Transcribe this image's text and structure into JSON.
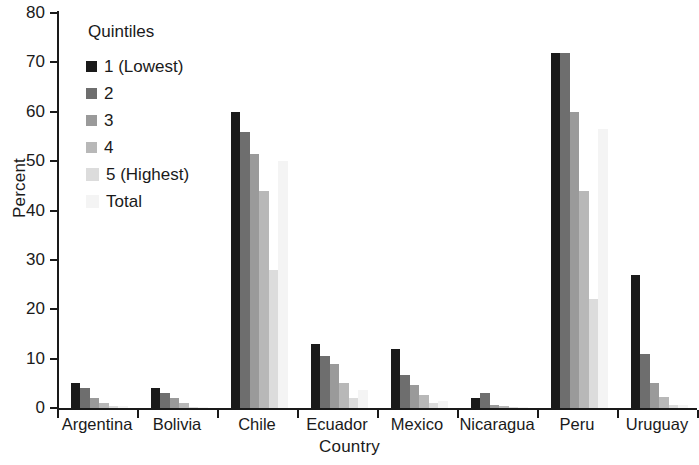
{
  "chart_data": {
    "type": "bar",
    "title": "",
    "xlabel": "Country",
    "ylabel": "Percent",
    "ylim": [
      0,
      80
    ],
    "yticks": [
      0,
      10,
      20,
      30,
      40,
      50,
      60,
      70,
      80
    ],
    "grid": false,
    "legend_position": "top-left",
    "legend_title": "Quintiles",
    "categories": [
      "Argentina",
      "Bolivia",
      "Chile",
      "Ecuador",
      "Mexico",
      "Nicaragua",
      "Peru",
      "Uruguay"
    ],
    "series": [
      {
        "name": "1 (Lowest)",
        "color": "#1a1a1a",
        "values": [
          5,
          4,
          60,
          13,
          12,
          2,
          72,
          27
        ]
      },
      {
        "name": "2",
        "color": "#6e6e6e",
        "values": [
          4,
          3,
          56,
          10.5,
          6.7,
          3,
          72,
          11
        ]
      },
      {
        "name": "3",
        "color": "#9a9a9a",
        "values": [
          2,
          2,
          51.5,
          9,
          4.6,
          0.7,
          60,
          5
        ]
      },
      {
        "name": "4",
        "color": "#b8b8b8",
        "values": [
          1,
          1,
          44,
          5,
          2.6,
          0.4,
          44,
          2.2
        ]
      },
      {
        "name": "5 (Highest)",
        "color": "#dcdcdc",
        "values": [
          0.5,
          0.3,
          28,
          2,
          1,
          0.3,
          22,
          0.6
        ]
      },
      {
        "name": "Total",
        "color": "#f4f4f4",
        "values": [
          0.4,
          0.3,
          50,
          3.6,
          1.5,
          0.3,
          56.5,
          0.6
        ]
      }
    ]
  },
  "legend": {
    "title": "Quintiles",
    "items": [
      {
        "label": "1 (Lowest)",
        "color": "#1a1a1a"
      },
      {
        "label": "2",
        "color": "#6e6e6e"
      },
      {
        "label": "3",
        "color": "#9a9a9a"
      },
      {
        "label": "4",
        "color": "#b8b8b8"
      },
      {
        "label": "5 (Highest)",
        "color": "#dcdcdc"
      },
      {
        "label": "Total",
        "color": "#f4f4f4"
      }
    ]
  },
  "axes": {
    "y_title": "Percent",
    "x_title": "Country",
    "y_tick_labels": [
      "0",
      "10",
      "20",
      "30",
      "40",
      "50",
      "60",
      "70",
      "80"
    ],
    "x_tick_labels": [
      "Argentina",
      "Bolivia",
      "Chile",
      "Ecuador",
      "Mexico",
      "Nicaragua",
      "Peru",
      "Uruguay"
    ]
  }
}
